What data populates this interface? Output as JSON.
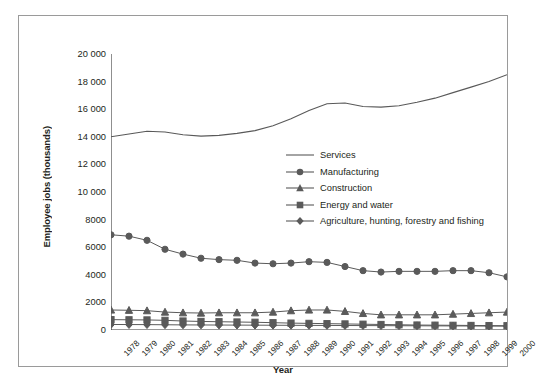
{
  "chart_data": {
    "type": "line",
    "title": "",
    "xlabel": "Year",
    "ylabel": "Employee jobs (thousands)",
    "ylim": [
      0,
      20000
    ],
    "ytick_labels": [
      "20 000",
      "18 000",
      "16 000",
      "14 000",
      "12 000",
      "10 000",
      "8000",
      "6000",
      "4000",
      "2000",
      "0"
    ],
    "ytick_values": [
      20000,
      18000,
      16000,
      14000,
      12000,
      10000,
      8000,
      6000,
      4000,
      2000,
      0
    ],
    "grid": false,
    "legend_position": "center-right-inside",
    "categories": [
      "1978",
      "1979",
      "1980",
      "1981",
      "1982",
      "1983",
      "1984",
      "1985",
      "1986",
      "1987",
      "1988",
      "1989",
      "1990",
      "1991",
      "1992",
      "1993",
      "1994",
      "1995",
      "1996",
      "1997",
      "1998",
      "1999",
      "2000"
    ],
    "x": [
      1978,
      1979,
      1980,
      1981,
      1982,
      1983,
      1984,
      1985,
      1986,
      1987,
      1988,
      1989,
      1990,
      1991,
      1992,
      1993,
      1994,
      1995,
      1996,
      1997,
      1998,
      1999,
      2000
    ],
    "series": [
      {
        "name": "Services",
        "marker": "none",
        "color": "#595959",
        "values": [
          14000,
          14200,
          14400,
          14350,
          14150,
          14050,
          14100,
          14250,
          14450,
          14800,
          15300,
          15900,
          16400,
          16450,
          16200,
          16150,
          16250,
          16500,
          16800,
          17200,
          17600,
          18000,
          18500
        ]
      },
      {
        "name": "Manufacturing",
        "marker": "circle",
        "color": "#5a5a5a",
        "values": [
          6900,
          6800,
          6500,
          5850,
          5500,
          5200,
          5100,
          5050,
          4850,
          4800,
          4850,
          4950,
          4900,
          4600,
          4300,
          4200,
          4250,
          4250,
          4250,
          4300,
          4300,
          4150,
          3850
        ]
      },
      {
        "name": "Construction",
        "marker": "triangle",
        "color": "#5a5a5a",
        "values": [
          1450,
          1430,
          1400,
          1300,
          1250,
          1230,
          1250,
          1250,
          1250,
          1300,
          1400,
          1450,
          1450,
          1350,
          1200,
          1100,
          1100,
          1100,
          1100,
          1150,
          1200,
          1250,
          1300
        ]
      },
      {
        "name": "Energy and water",
        "marker": "square",
        "color": "#5a5a5a",
        "values": [
          750,
          740,
          730,
          700,
          650,
          620,
          600,
          580,
          560,
          530,
          500,
          480,
          460,
          440,
          420,
          400,
          380,
          360,
          350,
          340,
          330,
          320,
          310
        ]
      },
      {
        "name": "Agriculture, hunting, forestry and fishing",
        "marker": "diamond",
        "color": "#5a5a5a",
        "values": [
          400,
          395,
          390,
          380,
          370,
          365,
          360,
          355,
          350,
          345,
          340,
          335,
          330,
          325,
          320,
          315,
          310,
          305,
          300,
          295,
          290,
          285,
          280
        ]
      }
    ]
  }
}
